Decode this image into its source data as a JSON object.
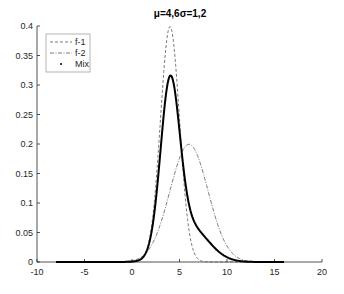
{
  "chart_data": {
    "type": "line",
    "title": "μ=4,6σ=1,2",
    "xlabel": "",
    "ylabel": "",
    "xlim": [
      -10,
      20
    ],
    "ylim": [
      0,
      0.4
    ],
    "xticks": [
      -10,
      -5,
      0,
      5,
      10,
      15,
      20
    ],
    "yticks": [
      0,
      0.05,
      0.1,
      0.15,
      0.2,
      0.25,
      0.3,
      0.35,
      0.4
    ],
    "xtick_labels": [
      "-10",
      "-5",
      "0",
      "5",
      "10",
      "15",
      "20"
    ],
    "ytick_labels": [
      "0",
      "0.05",
      "0.1",
      "0.15",
      "0.2",
      "0.25",
      "0.3",
      "0.35",
      "0.4"
    ],
    "grid": false,
    "legend_position": "upper-left",
    "x_range_plotted": [
      -8,
      16
    ],
    "series": [
      {
        "name": "f-1",
        "style": "dashed",
        "color": "#555555",
        "distribution": "normal",
        "mu": 4,
        "sigma": 1,
        "peak": 0.399
      },
      {
        "name": "f-2",
        "style": "dash-dot",
        "color": "#555555",
        "distribution": "normal",
        "mu": 6,
        "sigma": 2,
        "peak": 0.199
      },
      {
        "name": "Mix",
        "style": "dotted-thick",
        "color": "#000000",
        "weights": [
          0.7,
          0.3
        ],
        "peak": 0.305
      }
    ]
  },
  "legend": {
    "items": [
      "f-1",
      "f-2",
      "Mix"
    ]
  }
}
